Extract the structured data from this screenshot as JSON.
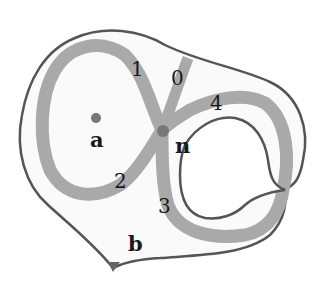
{
  "figure": {
    "points": [
      {
        "id": "a",
        "label": "a"
      },
      {
        "id": "n",
        "label": "n"
      },
      {
        "id": "b",
        "label": "b"
      }
    ],
    "arcs": [
      {
        "id": "arc-0",
        "label": "0"
      },
      {
        "id": "arc-1",
        "label": "1"
      },
      {
        "id": "arc-2",
        "label": "2"
      },
      {
        "id": "arc-3",
        "label": "3"
      },
      {
        "id": "arc-4",
        "label": "4"
      }
    ],
    "colors": {
      "outline": "#555555",
      "band": "#a9a9a9",
      "point": "#777777",
      "fill": "#fafafa"
    }
  }
}
